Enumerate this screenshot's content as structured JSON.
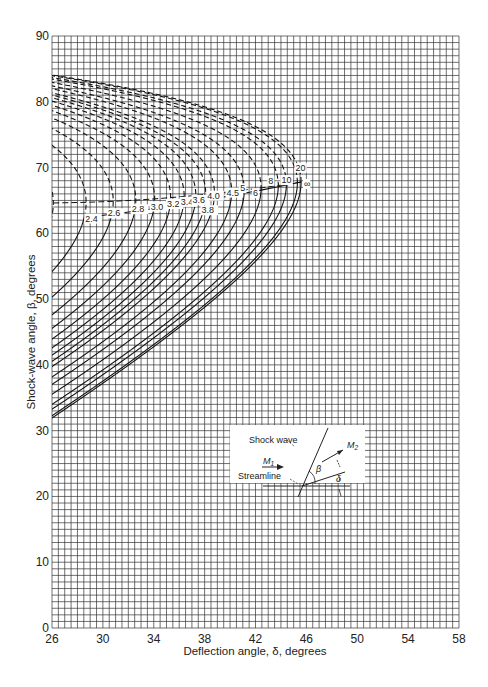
{
  "chart_data": {
    "type": "line",
    "title": "",
    "xlabel": "Deflection angle, δ, degrees",
    "ylabel": "Shock-wave angle, β, degrees",
    "xlim": [
      26,
      58
    ],
    "ylim": [
      0,
      90
    ],
    "x_ticks": [
      "26",
      "30",
      "34",
      "38",
      "42",
      "46",
      "50",
      "54",
      "58"
    ],
    "y_ticks": [
      "0",
      "10",
      "20",
      "30",
      "40",
      "50",
      "60",
      "70",
      "80",
      "90"
    ],
    "grid": {
      "on": true,
      "x_minor_step": 0.5,
      "y_minor_step": 1
    },
    "gamma": 1.4,
    "series": [
      {
        "name": "M1=2.2",
        "mach": 2.2,
        "label": "M₁=2.2"
      },
      {
        "name": "2.4",
        "mach": 2.4,
        "label": "2.4"
      },
      {
        "name": "2.6",
        "mach": 2.6,
        "label": "2.6"
      },
      {
        "name": "2.8",
        "mach": 2.8,
        "label": "2.8"
      },
      {
        "name": "3.0",
        "mach": 3.0,
        "label": "3.0"
      },
      {
        "name": "3.2",
        "mach": 3.2,
        "label": "3.2"
      },
      {
        "name": "3.4",
        "mach": 3.4,
        "label": "3.4"
      },
      {
        "name": "3.6",
        "mach": 3.6,
        "label": "3.6"
      },
      {
        "name": "3.8",
        "mach": 3.8,
        "label": "3.8"
      },
      {
        "name": "4.0",
        "mach": 4.0,
        "label": "4.0"
      },
      {
        "name": "4.5",
        "mach": 4.5,
        "label": "4.5"
      },
      {
        "name": "5",
        "mach": 5,
        "label": "5"
      },
      {
        "name": "6",
        "mach": 6,
        "label": "6"
      },
      {
        "name": "8",
        "mach": 8,
        "label": "8"
      },
      {
        "name": "10",
        "mach": 10,
        "label": "10"
      },
      {
        "name": "20",
        "mach": 20,
        "label": "20"
      },
      {
        "name": "∞",
        "mach": 1000,
        "label": "∞"
      }
    ],
    "line_styles": {
      "weak_branch": "solid",
      "strong_branch": "dashed"
    },
    "annotations": [
      "M₁=2.2",
      "2.4",
      "2.6",
      "2.8",
      "3.0",
      "3.2",
      "3.4",
      "3.6",
      "3.8",
      "4.0",
      "4.5",
      "5",
      "6",
      "8",
      "10",
      "20",
      "∞"
    ]
  },
  "inset": {
    "shock_wave_label": "Shock wave",
    "streamline_label": "Streamline",
    "m1_label": "M",
    "m1_sub": "1",
    "m2_label": "M",
    "m2_sub": "2",
    "beta_label": "β",
    "delta_label": "δ"
  },
  "axis": {
    "x_title": "Deflection angle, δ, degrees",
    "y_title": "Shock-wave angle, β, degrees"
  }
}
